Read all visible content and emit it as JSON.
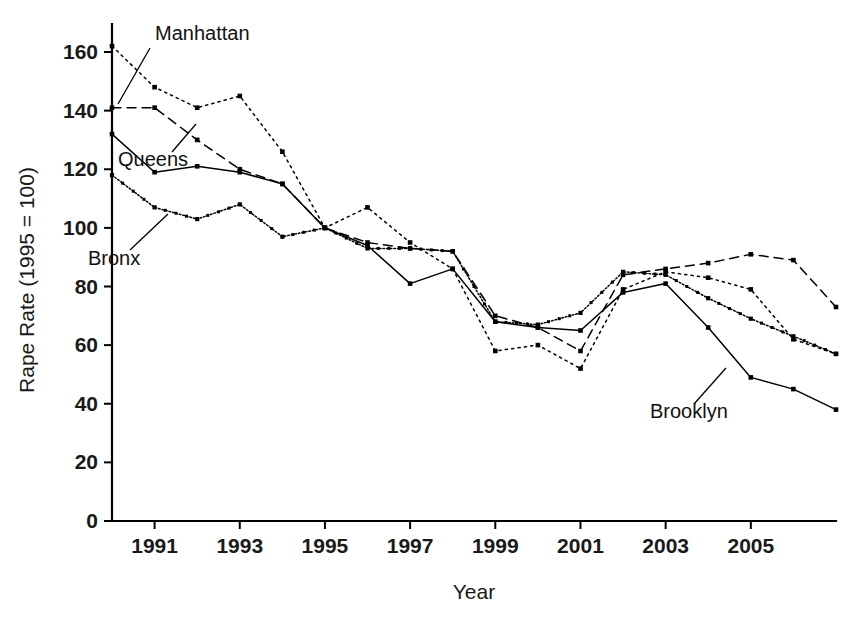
{
  "chart_data": {
    "type": "line",
    "title": "",
    "xlabel": "Year",
    "ylabel": "Rape Rate (1995 = 100)",
    "xlim": [
      1990,
      2007
    ],
    "ylim": [
      0,
      168
    ],
    "grid": false,
    "legend_position": "inline-annotations",
    "x": [
      1990,
      1991,
      1992,
      1993,
      1994,
      1995,
      1996,
      1997,
      1998,
      1999,
      2000,
      2001,
      2002,
      2003,
      2004,
      2005,
      2006,
      2007
    ],
    "y_ticks": [
      0,
      20,
      40,
      60,
      80,
      100,
      120,
      140,
      160
    ],
    "x_ticks": [
      1991,
      1993,
      1995,
      1997,
      1999,
      2001,
      2003,
      2005
    ],
    "series": [
      {
        "name": "Manhattan",
        "style": "dotted",
        "values": [
          162,
          148,
          141,
          145,
          126,
          100,
          107,
          95,
          86,
          58,
          60,
          52,
          79,
          85,
          83,
          79,
          62,
          57
        ]
      },
      {
        "name": "Queens",
        "style": "dashed",
        "values": [
          141,
          141,
          130,
          120,
          115,
          100,
          95,
          93,
          92,
          70,
          66,
          58,
          84,
          86,
          88,
          91,
          89,
          73
        ]
      },
      {
        "name": "Bronx",
        "style": "dotted-dense",
        "values": [
          118,
          107,
          103,
          108,
          97,
          100,
          93,
          93,
          92,
          68,
          67,
          71,
          85,
          84,
          76,
          69,
          63,
          57
        ]
      },
      {
        "name": "Brooklyn",
        "style": "solid",
        "values": [
          132,
          119,
          121,
          119,
          115,
          100,
          94,
          81,
          86,
          68,
          66,
          65,
          78,
          81,
          66,
          49,
          45,
          38
        ]
      }
    ],
    "annotations": [
      {
        "text": "Manhattan",
        "label_x": 155,
        "label_y": 40,
        "leader": [
          [
            150,
            48
          ],
          [
            118,
            104
          ]
        ]
      },
      {
        "text": "Queens",
        "label_x": 118,
        "label_y": 166,
        "leader": [
          [
            172,
            152
          ],
          [
            196,
            124
          ]
        ]
      },
      {
        "text": "Bronx",
        "label_x": 88,
        "label_y": 265,
        "leader": [
          [
            130,
            250
          ],
          [
            168,
            214
          ]
        ]
      },
      {
        "text": "Brooklyn",
        "label_x": 650,
        "label_y": 418,
        "leader": [
          [
            694,
            404
          ],
          [
            726,
            368
          ]
        ]
      }
    ]
  }
}
